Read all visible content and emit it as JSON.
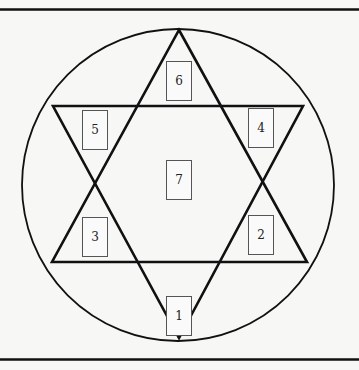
{
  "diagram": {
    "type": "hexagram-in-circle",
    "colors": {
      "stroke": "#111111",
      "background": "#f7f7f6",
      "box_border": "#555555"
    },
    "boxes": [
      {
        "label": "1",
        "x": 166,
        "y": 296
      },
      {
        "label": "2",
        "x": 248,
        "y": 215
      },
      {
        "label": "3",
        "x": 82,
        "y": 217
      },
      {
        "label": "4",
        "x": 248,
        "y": 108
      },
      {
        "label": "5",
        "x": 82,
        "y": 110
      },
      {
        "label": "6",
        "x": 166,
        "y": 61
      },
      {
        "label": "7",
        "x": 166,
        "y": 160
      }
    ]
  }
}
